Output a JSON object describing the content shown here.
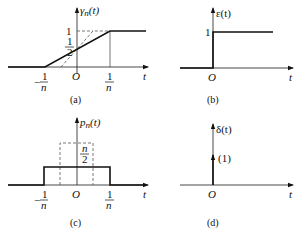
{
  "panels": {
    "a": {
      "caption": "(a)",
      "ylabel_main": "γ",
      "ylabel_sub": "n",
      "ylabel_arg": "(t)",
      "xlabel": "t",
      "origin": "O",
      "level_one": "1",
      "half_num": "1",
      "half_den": "2",
      "neg_tick_num": "1",
      "neg_tick_den": "n",
      "neg_sign": "−",
      "pos_tick_num": "1",
      "pos_tick_den": "n"
    },
    "b": {
      "caption": "(b)",
      "ylabel": "ε(t)",
      "xlabel": "t",
      "origin": "O",
      "level_one": "1"
    },
    "c": {
      "caption": "(c)",
      "ylabel_main": "p",
      "ylabel_sub": "n",
      "ylabel_arg": "(t)",
      "xlabel": "t",
      "origin": "O",
      "height_num": "n",
      "height_den": "2",
      "neg_tick_num": "1",
      "neg_tick_den": "n",
      "neg_sign": "−",
      "pos_tick_num": "1",
      "pos_tick_den": "n"
    },
    "d": {
      "caption": "(d)",
      "ylabel": "δ(t)",
      "xlabel": "t",
      "origin": "O",
      "impulse_weight": "(1)"
    }
  }
}
